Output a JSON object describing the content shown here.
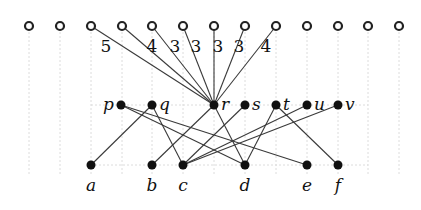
{
  "diagram": {
    "top_row": {
      "y": 26,
      "xs": [
        29,
        60,
        91,
        122,
        152,
        183,
        214,
        245,
        276,
        307,
        338,
        368,
        399
      ]
    },
    "middle_row": {
      "y": 105,
      "nodes": [
        {
          "id": "p",
          "x": 121
        },
        {
          "id": "q",
          "x": 152
        },
        {
          "id": "r",
          "x": 214
        },
        {
          "id": "s",
          "x": 245
        },
        {
          "id": "t",
          "x": 276
        },
        {
          "id": "u",
          "x": 307
        },
        {
          "id": "v",
          "x": 338
        }
      ]
    },
    "bottom_row": {
      "y": 165,
      "nodes": [
        {
          "id": "a",
          "x": 91
        },
        {
          "id": "b",
          "x": 152
        },
        {
          "id": "c",
          "x": 183
        },
        {
          "id": "d",
          "x": 245
        },
        {
          "id": "e",
          "x": 307
        },
        {
          "id": "f",
          "x": 338
        }
      ]
    },
    "fan_edges_from_r_to_top_columns": [
      2,
      3,
      4,
      5,
      6,
      7,
      8
    ],
    "weights": [
      "5",
      "4",
      "3",
      "3",
      "3",
      "3",
      "4"
    ],
    "weight_positions": [
      [
        106,
        52
      ],
      [
        152,
        52
      ],
      [
        175,
        52
      ],
      [
        196,
        52
      ],
      [
        218,
        52
      ],
      [
        239,
        52
      ],
      [
        266,
        52
      ]
    ],
    "edges": [
      [
        "q",
        "a"
      ],
      [
        "q",
        "c"
      ],
      [
        "r",
        "b"
      ],
      [
        "r",
        "d"
      ],
      [
        "s",
        "c"
      ],
      [
        "t",
        "d"
      ],
      [
        "t",
        "f"
      ],
      [
        "u",
        "c"
      ],
      [
        "v",
        "c"
      ],
      [
        "p",
        "d"
      ],
      [
        "p",
        "e"
      ]
    ],
    "labels": {
      "p": "p",
      "q": "q",
      "r": "r",
      "s": "s",
      "t": "t",
      "u": "u",
      "v": "v",
      "a": "a",
      "b": "b",
      "c": "c",
      "d": "d",
      "e": "e",
      "f": "f"
    }
  }
}
